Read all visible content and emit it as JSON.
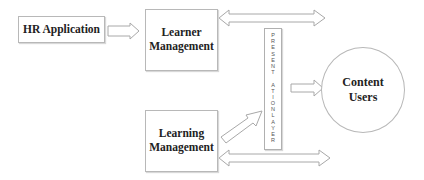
{
  "diagram": {
    "nodes": {
      "hr_application": {
        "label": "HR Application"
      },
      "learner_management": {
        "line1": "Learner",
        "line2": "Management"
      },
      "learning_management": {
        "line1": "Learning",
        "line2": "Management"
      },
      "presentation_layer": {
        "letters": [
          "P",
          "R",
          "E",
          "S",
          "E",
          "N",
          "T",
          " ",
          "A",
          "T",
          "I",
          "O",
          "N",
          "L",
          "A",
          "Y",
          "E",
          "R"
        ],
        "label": "PRESENT ATIONLAYER"
      },
      "content_users": {
        "line1": "Content",
        "line2": "Users"
      }
    },
    "edges": [
      {
        "from": "HR Application",
        "to": "Learner Management",
        "type": "hollow-arrow"
      },
      {
        "from": "Learner Management",
        "to": "Content Users",
        "type": "double-hollow-arrow"
      },
      {
        "from": "Learning Management",
        "to": "Presentation Layer",
        "type": "hollow-arrow-diagonal"
      },
      {
        "from": "Presentation Layer",
        "to": "Content Users",
        "type": "hollow-arrow"
      },
      {
        "from": "Learning Management",
        "to": "Content Users",
        "type": "double-hollow-arrow"
      }
    ],
    "colors": {
      "stroke": "#a8a8a8",
      "text": "#222222",
      "background": "#ffffff"
    }
  }
}
